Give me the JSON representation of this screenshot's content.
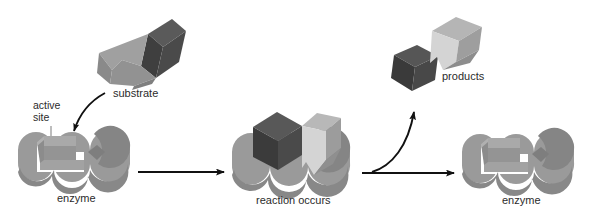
{
  "figure": {
    "background_color": "#ffffff",
    "width": 611,
    "height": 217
  },
  "palette": {
    "enzyme_body": "#9a9a9a",
    "enzyme_top": "#a8a8a8",
    "enzyme_shadow": "#828282",
    "enzyme_inner_wall": "#8a8a8a",
    "substrate_light": "#8e8e8e",
    "substrate_light_top": "#9c9c9c",
    "substrate_dark": "#3f3f3f",
    "substrate_dark_top": "#565656",
    "product_light": "#d2d2d2",
    "product_light_top": "#bdbdbd",
    "product_dark": "#3a3a3a",
    "product_dark_top": "#505050",
    "arrow": "#111111",
    "text": "#2b2b2b",
    "leader_line": "#9a9a9a"
  },
  "labels": {
    "active_site_line1": "active",
    "active_site_line2": "site",
    "substrate": "substrate",
    "enzyme_left": "enzyme",
    "reaction_occurs": "reaction occurs",
    "products": "products",
    "enzyme_right": "enzyme"
  },
  "stages": [
    {
      "id": "stage-1",
      "name": "free-enzyme-and-substrate",
      "enzyme_label": "enzyme",
      "extra_labels": [
        "substrate",
        "active site"
      ]
    },
    {
      "id": "stage-2",
      "name": "enzyme-substrate-complex",
      "enzyme_label": "reaction occurs",
      "extra_labels": []
    },
    {
      "id": "stage-3",
      "name": "free-enzyme-and-products",
      "enzyme_label": "enzyme",
      "extra_labels": [
        "products"
      ]
    }
  ],
  "arrows": [
    {
      "id": "arrow-substrate-to-active-site",
      "type": "curved",
      "direction": "down-left"
    },
    {
      "id": "arrow-stage1-to-stage2",
      "type": "straight",
      "direction": "right"
    },
    {
      "id": "arrow-stage2-to-stage3",
      "type": "straight",
      "direction": "right"
    },
    {
      "id": "arrow-stage2-to-products",
      "type": "curved",
      "direction": "up-right"
    }
  ]
}
